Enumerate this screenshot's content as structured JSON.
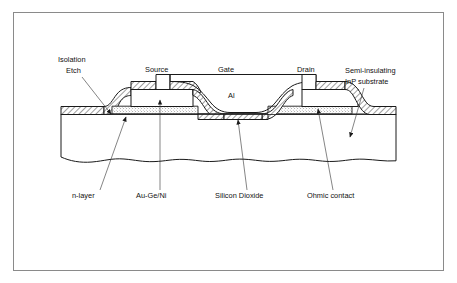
{
  "figure": {
    "kind": "cross-section-diagram",
    "border_color": "#888888",
    "background_color": "#ffffff",
    "line_color": "#1a1a1a"
  },
  "labels": {
    "isolation_etch_line1": "Isolation",
    "isolation_etch_line2": "Etch",
    "source": "Source",
    "gate": "Gate",
    "al": "Al",
    "drain": "Drain",
    "semi_insulating_line1": "Semi-insulating",
    "semi_insulating_line2": "InP substrate",
    "n_layer": "n-layer",
    "au_ge_ni": "Au-Ge/Ni",
    "silicon_dioxide": "Silicon Dioxide",
    "ohmic_contact": "Ohmic contact"
  },
  "layers": {
    "substrate": {
      "name": "Semi-insulating InP substrate",
      "fill": "#ffffff",
      "pattern": "plain"
    },
    "n_layer": {
      "name": "n-layer",
      "fill": "#ffffff",
      "pattern": "stipple"
    },
    "silicon_dioxide": {
      "name": "Silicon Dioxide",
      "fill": "#ffffff",
      "pattern": "diagonal-hatch"
    },
    "ohmic_contact": {
      "name": "Au-Ge/Ni ohmic contact",
      "fill": "#ffffff",
      "pattern": "plain"
    },
    "gate_metal": {
      "name": "Al",
      "fill": "none",
      "pattern": "outline"
    }
  }
}
